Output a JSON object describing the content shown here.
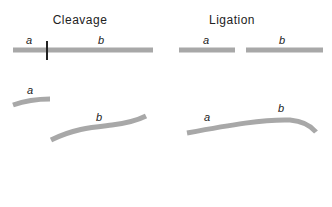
{
  "panels": {
    "cleavage": {
      "title": "Cleavage",
      "before": {
        "strand_labels": [
          "a",
          "b"
        ],
        "cut_mark": true
      },
      "after": {
        "fragments": [
          {
            "label": "a"
          },
          {
            "label": "b"
          }
        ]
      }
    },
    "ligation": {
      "title": "Ligation",
      "before": {
        "fragments": [
          {
            "label": "a"
          },
          {
            "label": "b"
          }
        ]
      },
      "after": {
        "strand_labels": [
          "a",
          "b"
        ],
        "joined": true
      }
    }
  },
  "colors": {
    "strand": "#a8a8a8",
    "cut_mark": "#222222",
    "text": "#222222",
    "background": "#ffffff"
  }
}
